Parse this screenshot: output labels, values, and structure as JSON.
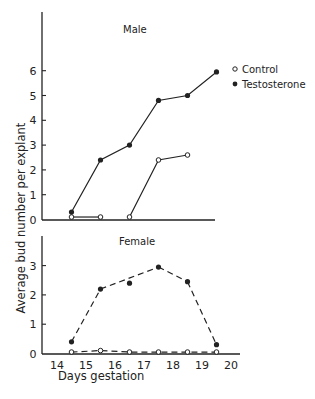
{
  "chart_data": [
    {
      "type": "line",
      "title": "Male",
      "xlabel": "Days gestation",
      "ylabel": "Average bud number per explant",
      "xlim": [
        14,
        20
      ],
      "ylim": [
        0,
        6.8
      ],
      "yticks": [
        0,
        1,
        2,
        3,
        4,
        5,
        6
      ],
      "ytick_labels": [
        "0",
        "1",
        "2",
        "3",
        "4",
        "5",
        "6"
      ],
      "grid": false,
      "legend": {
        "position": "right",
        "entries": [
          {
            "label": "Control",
            "marker": "open-circle"
          },
          {
            "label": "Testosterone",
            "marker": "filled-circle"
          }
        ]
      },
      "series": [
        {
          "name": "Control",
          "style": "solid",
          "marker": "open-circle",
          "segments": [
            [
              0,
              1
            ],
            [
              2,
              3,
              4
            ]
          ],
          "x": [
            14.5,
            15.5,
            16.5,
            17.5,
            18.5
          ],
          "y": [
            0.1,
            0.1,
            0.1,
            2.4,
            2.6
          ]
        },
        {
          "name": "Testosterone",
          "style": "solid",
          "marker": "filled-circle",
          "segments": [
            [
              0,
              1,
              2,
              3,
              4,
              5
            ]
          ],
          "x": [
            14.5,
            15.5,
            16.5,
            17.5,
            18.5,
            19.5
          ],
          "y": [
            0.3,
            2.4,
            3.0,
            4.8,
            5.0,
            5.95
          ]
        }
      ]
    },
    {
      "type": "line",
      "title": "Female",
      "xlabel": "Days gestation",
      "ylabel": "Average bud number per explant",
      "xlim": [
        14,
        20
      ],
      "ylim": [
        0,
        4
      ],
      "xticks": [
        14,
        15,
        16,
        17,
        18,
        19,
        20
      ],
      "xtick_labels": [
        "14",
        "15",
        "16",
        "17",
        "18",
        "19",
        "20"
      ],
      "yticks": [
        0,
        1,
        2,
        3
      ],
      "ytick_labels": [
        "0",
        "1",
        "2",
        "3"
      ],
      "grid": false,
      "series": [
        {
          "name": "Control",
          "style": "dashed",
          "marker": "open-circle",
          "segments": [
            [
              0,
              1,
              2,
              3,
              4,
              5
            ]
          ],
          "x": [
            14.5,
            15.5,
            16.5,
            17.5,
            18.5,
            19.5
          ],
          "y": [
            0.05,
            0.1,
            0.05,
            0.05,
            0.05,
            0.05
          ]
        },
        {
          "name": "Testosterone",
          "style": "dashed",
          "marker": "filled-circle",
          "segments": [
            [
              0,
              1
            ],
            [
              1,
              3
            ],
            [
              3,
              4
            ],
            [
              4,
              5
            ]
          ],
          "x": [
            14.5,
            15.5,
            16.5,
            17.5,
            18.5,
            19.5
          ],
          "y": [
            0.4,
            2.2,
            2.4,
            2.95,
            2.45,
            0.3
          ]
        }
      ]
    }
  ]
}
